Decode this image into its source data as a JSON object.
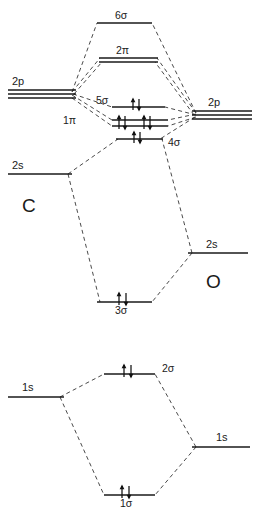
{
  "diagram": {
    "type": "molecular-orbital-correlation-diagram",
    "left_atom": "C",
    "right_atom": "O",
    "line_color": "#1a1a1a",
    "correlation_color": "#4a4a4a",
    "background": "#ffffff"
  },
  "atomic_orbitals": {
    "left": [
      {
        "label": "2p",
        "degeneracy": 3,
        "electrons": 0
      },
      {
        "label": "2s",
        "degeneracy": 1,
        "electrons": 0
      },
      {
        "label": "1s",
        "degeneracy": 1,
        "electrons": 0
      }
    ],
    "right": [
      {
        "label": "2p",
        "degeneracy": 3,
        "electrons": 0
      },
      {
        "label": "2s",
        "degeneracy": 1,
        "electrons": 0
      },
      {
        "label": "1s",
        "degeneracy": 1,
        "electrons": 0
      }
    ]
  },
  "molecular_orbitals": [
    {
      "label": "6σ",
      "degeneracy": 1,
      "electrons": 0,
      "label_position": "above"
    },
    {
      "label": "2π",
      "degeneracy": 2,
      "electrons": 0,
      "label_position": "above"
    },
    {
      "label": "5σ",
      "degeneracy": 1,
      "electrons": 2,
      "label_position": "left"
    },
    {
      "label": "1π",
      "degeneracy": 2,
      "electrons": 4,
      "label_position": "left"
    },
    {
      "label": "4σ",
      "degeneracy": 1,
      "electrons": 2,
      "label_position": "right"
    },
    {
      "label": "3σ",
      "degeneracy": 1,
      "electrons": 2,
      "label_position": "below"
    },
    {
      "label": "2σ",
      "degeneracy": 1,
      "electrons": 2,
      "label_position": "right"
    },
    {
      "label": "1σ",
      "degeneracy": 1,
      "electrons": 2,
      "label_position": "below"
    }
  ],
  "labels": {
    "mo_6sigma": "6σ",
    "mo_2pi": "2π",
    "mo_5sigma": "5σ",
    "mo_1pi": "1π",
    "mo_4sigma": "4σ",
    "mo_3sigma": "3σ",
    "mo_2sigma": "2σ",
    "mo_1sigma": "1σ",
    "ao_left_2p": "2p",
    "ao_left_2s": "2s",
    "ao_left_1s": "1s",
    "ao_right_2p": "2p",
    "ao_right_2s": "2s",
    "ao_right_1s": "1s",
    "atom_left": "C",
    "atom_right": "O"
  }
}
